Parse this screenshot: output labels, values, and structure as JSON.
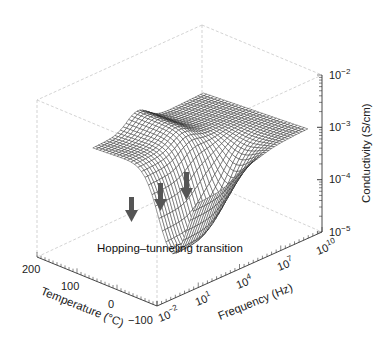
{
  "chart_data": {
    "type": "surface3d",
    "title": "",
    "annotation": "Hopping–tunneling transition",
    "xlabel": "Temperature (°C)",
    "ylabel": "Frequency (Hz)",
    "zlabel": "Conductivity (S/cm)",
    "x_ticks": [
      "200",
      "100",
      "0",
      "−100"
    ],
    "x_range": [
      -100,
      200
    ],
    "y_ticks": [
      {
        "base": "10",
        "exp": "−2"
      },
      {
        "base": "10",
        "exp": "1"
      },
      {
        "base": "10",
        "exp": "4"
      },
      {
        "base": "10",
        "exp": "7"
      },
      {
        "base": "10",
        "exp": "10"
      }
    ],
    "y_range_log10": [
      -2,
      10
    ],
    "z_ticks": [
      {
        "base": "10",
        "exp": "−5"
      },
      {
        "base": "10",
        "exp": "−4"
      },
      {
        "base": "10",
        "exp": "−3"
      },
      {
        "base": "10",
        "exp": "−2"
      }
    ],
    "z_range_log10": [
      -5,
      -2
    ],
    "z_scale": "log",
    "y_scale": "log",
    "arrows": 3,
    "arrow_color": "#555555",
    "mesh_color": "#222222",
    "grid": "box wireframe (dashed light gray)"
  }
}
